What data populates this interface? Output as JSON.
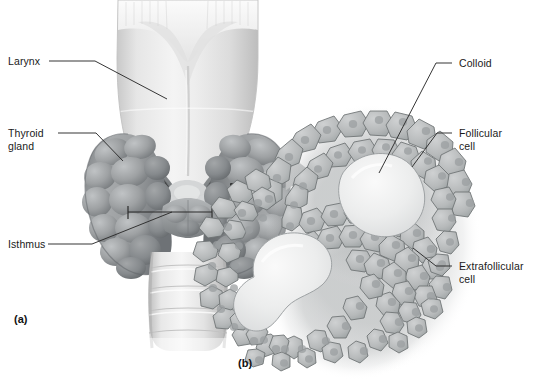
{
  "figure": {
    "background_color": "#ffffff",
    "width": 534,
    "height": 384
  },
  "panels": [
    {
      "id": "a",
      "tag": "(a)",
      "description": "Anterior view of larynx, thyroid gland, isthmus and trachea"
    },
    {
      "id": "b",
      "tag": "(b)",
      "description": "Magnified histology of thyroid follicles"
    }
  ],
  "labels": {
    "larynx": "Larynx",
    "thyroid_gland": "Thyroid\ngland",
    "isthmus": "Isthmus",
    "colloid": "Colloid",
    "follicular_cell": "Follicular\ncell",
    "extrafollicular_cell": "Extrafollicular\ncell"
  },
  "markers": {
    "magnified_region_box": "small black square on right thyroid lobe",
    "isthmus_bracket": "horizontal bracket spanning the isthmus",
    "zoom_arrow": "thick gray curved arrow pointing right from panel a to panel b"
  },
  "colors": {
    "background": "#ffffff",
    "line": "#2b2b2b",
    "text": "#1a1a1a",
    "cartilage_light": "#ececec",
    "cartilage_mid": "#d5d5d5",
    "thyroid_mid": "#9fa2a4",
    "thyroid_dark": "#6f7376",
    "colloid": "#e9eaea",
    "cell_fill": "#b9bcbd",
    "cell_outline": "#6d7173",
    "arrow_gray": "#c3c5c6"
  },
  "structures": {
    "panel_a": [
      "thyroid cartilage (larynx) with superior notch",
      "cricothyroid muscles",
      "right thyroid lobe",
      "left thyroid lobe",
      "isthmus",
      "trachea with cartilage rings"
    ],
    "panel_b": [
      "upper follicle with colloid",
      "lower follicle with colloid",
      "ring of cuboidal follicular cells",
      "extrafollicular (parafollicular) cells between follicles"
    ]
  }
}
